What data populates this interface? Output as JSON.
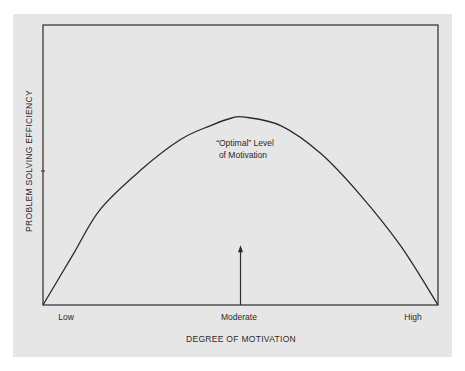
{
  "chart_data": {
    "type": "line",
    "title": "",
    "xlabel": "DEGREE OF MOTIVATION",
    "ylabel": "PROBLEM SOLVING EFFICIENCY",
    "x_tick_labels": [
      "Low",
      "Moderate",
      "High"
    ],
    "x_tick_positions": [
      0.0,
      0.5,
      1.0
    ],
    "y_tick_labels": [],
    "xlim": [
      0,
      1
    ],
    "ylim": [
      0,
      1
    ],
    "grid": false,
    "legend": null,
    "series": [
      {
        "name": "Problem solving efficiency",
        "x": [
          0.0,
          0.076,
          0.144,
          0.246,
          0.347,
          0.423,
          0.478,
          0.511,
          0.603,
          0.704,
          0.805,
          0.906,
          1.0
        ],
        "y": [
          0.0,
          0.18,
          0.34,
          0.48,
          0.59,
          0.64,
          0.668,
          0.671,
          0.64,
          0.54,
          0.39,
          0.21,
          0.0
        ]
      }
    ],
    "annotations": [
      {
        "text_line1": "“Optimal” Level",
        "text_line2": "of Motivation",
        "x": 0.5,
        "arrow": {
          "from_y": 0.0,
          "to_y": 0.21,
          "direction": "up"
        }
      }
    ]
  },
  "labels": {
    "y_axis_title": "PROBLEM SOLVING EFFICIENCY",
    "x_axis_title": "DEGREE OF MOTIVATION",
    "x_low": "Low",
    "x_moderate": "Moderate",
    "x_high": "High",
    "optimal_line1": "“Optimal” Level",
    "optimal_line2": "of Motivation"
  },
  "colors": {
    "background": "#ffffff",
    "panel": "#e6e6e6",
    "ink": "#2a2a2a"
  }
}
